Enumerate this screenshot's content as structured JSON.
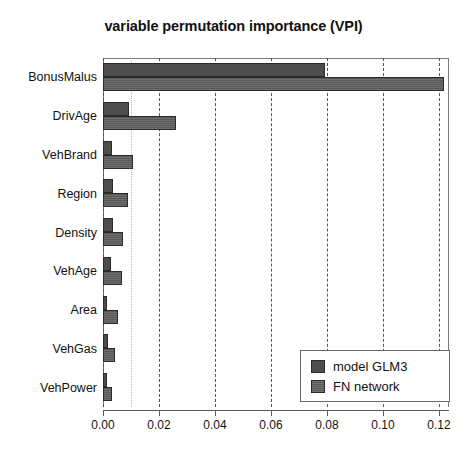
{
  "chart_data": {
    "type": "bar",
    "orientation": "horizontal",
    "title": "variable permutation importance (VPI)",
    "xlabel": "",
    "ylabel": "",
    "xlim": [
      0.0,
      0.1236
    ],
    "grid": true,
    "gridlines": [
      0.0,
      0.01,
      0.02,
      0.04,
      0.06,
      0.08,
      0.1,
      0.12
    ],
    "legend_position": "bottom-right",
    "xticks": [
      0.0,
      0.02,
      0.04,
      0.06,
      0.08,
      0.1,
      0.12
    ],
    "xticklabels": [
      "0.00",
      "0.02",
      "0.04",
      "0.06",
      "0.08",
      "0.10",
      "0.12"
    ],
    "categories": [
      "BonusMalus",
      "DrivAge",
      "VehBrand",
      "Region",
      "Density",
      "VehAge",
      "Area",
      "VehGas",
      "VehPower"
    ],
    "series": [
      {
        "name": "model GLM3",
        "color": "#4d4d4d",
        "values": [
          0.0793,
          0.0093,
          0.0032,
          0.0036,
          0.0036,
          0.0029,
          0.0014,
          0.0018,
          0.0014
        ]
      },
      {
        "name": "FN network",
        "color": "#5e5e5e",
        "values": [
          0.1218,
          0.026,
          0.0107,
          0.0089,
          0.0071,
          0.0068,
          0.0054,
          0.0043,
          0.0032
        ]
      }
    ]
  },
  "legend": {
    "items": [
      {
        "label": "model GLM3",
        "swatch": "glm3"
      },
      {
        "label": "FN network",
        "swatch": "fn"
      }
    ]
  }
}
